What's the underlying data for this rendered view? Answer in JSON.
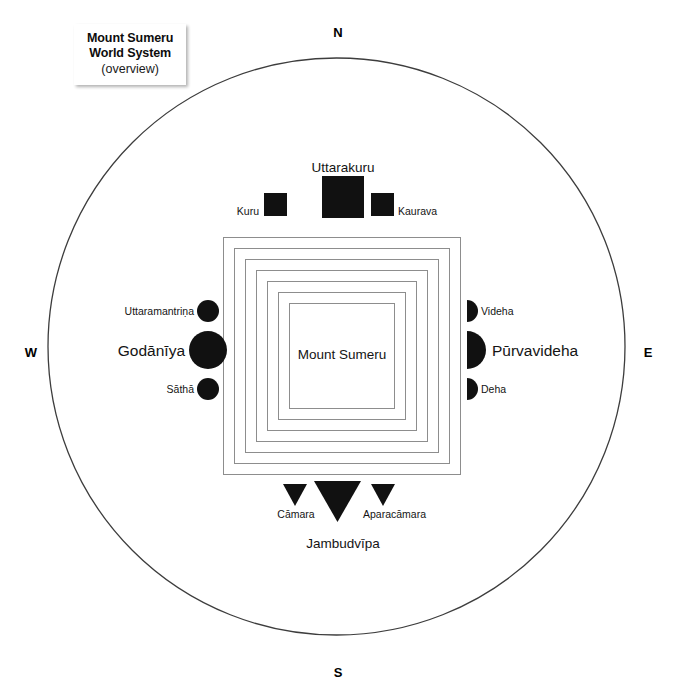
{
  "title_card": {
    "line1": "Mount Sumeru",
    "line2": "World System",
    "subtitle": "(overview)"
  },
  "cardinals": {
    "north": "N",
    "south": "S",
    "east": "E",
    "west": "W"
  },
  "center": {
    "label": "Mount Sumeru",
    "ring_count": 7
  },
  "continents": {
    "north": {
      "main": "Uttarakuru",
      "left": "Kuru",
      "right": "Kaurava",
      "shape": "square"
    },
    "west": {
      "main": "Godānīya",
      "upper": "Uttaramantriṇa",
      "lower": "Sāthā",
      "shape": "circle"
    },
    "east": {
      "main": "Pūrvavideha",
      "upper": "Videha",
      "lower": "Deha",
      "shape": "semicircle"
    },
    "south": {
      "main": "Jambudvīpa",
      "left": "Cāmara",
      "right": "Aparacāmara",
      "shape": "triangle"
    }
  },
  "colors": {
    "ink": "#141414",
    "fill": "#111111",
    "outline": "#3d3d3d",
    "ring": "#8a8a8a",
    "background": "#ffffff"
  }
}
